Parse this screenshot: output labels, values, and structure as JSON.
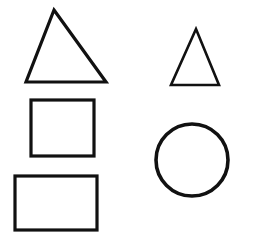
{
  "page": {
    "background_color": "#ffffff",
    "width": 254,
    "height": 240
  },
  "style": {
    "stroke_color": "#111111",
    "fill": "none"
  },
  "shapes": [
    {
      "id": "large-triangle",
      "kind": "triangle",
      "label": "Large triangle",
      "points": "54,10 106,82 26,82",
      "stroke_width": 3.2,
      "bbox": {
        "x": 26,
        "y": 10,
        "width": 80,
        "height": 72
      }
    },
    {
      "id": "small-triangle",
      "kind": "triangle",
      "label": "Small triangle",
      "points": "196,29 219,85 171,85",
      "stroke_width": 2.6,
      "bbox": {
        "x": 171,
        "y": 29,
        "width": 48,
        "height": 56
      }
    },
    {
      "id": "square",
      "kind": "square",
      "label": "Square",
      "stroke_width": 3.2,
      "bbox": {
        "x": 31,
        "y": 100,
        "width": 63,
        "height": 56
      }
    },
    {
      "id": "rectangle",
      "kind": "rectangle",
      "label": "Rectangle",
      "stroke_width": 3.2,
      "bbox": {
        "x": 15,
        "y": 176,
        "width": 82,
        "height": 54
      }
    },
    {
      "id": "circle",
      "kind": "circle",
      "label": "Circle",
      "stroke_width": 3.6,
      "center": {
        "cx": 192,
        "cy": 160
      },
      "radius": 36
    }
  ]
}
